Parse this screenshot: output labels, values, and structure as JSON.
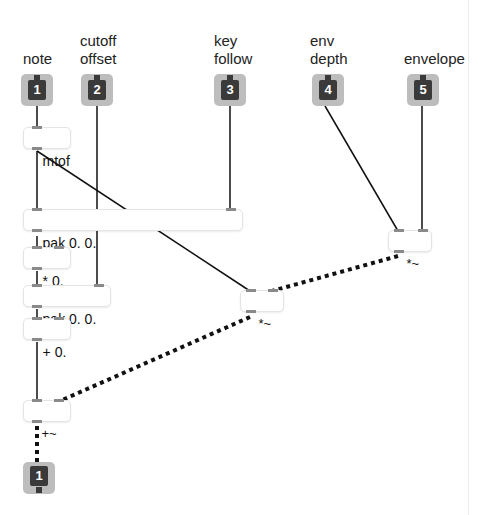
{
  "patch": {
    "inlets": [
      {
        "number": "1",
        "label": "note"
      },
      {
        "number": "2",
        "label": "cutoff\noffset"
      },
      {
        "number": "3",
        "label": "key\nfollow"
      },
      {
        "number": "4",
        "label": "env\ndepth"
      },
      {
        "number": "5",
        "label": "envelope"
      }
    ],
    "objects": {
      "mtof": "mtof",
      "pak_top": "pak 0. 0.",
      "mul": "* 0.",
      "pak_bottom": "pak 0. 0.",
      "add": "+ 0.",
      "sig_mul_right": "*~",
      "sig_mul_mid": "*~",
      "sig_add": "+~"
    },
    "outlets": [
      {
        "number": "1"
      }
    ]
  },
  "colors": {
    "inlet_bg": "#bdbdbd",
    "inlet_core": "#3a3a3a",
    "patchcord": "#111111",
    "signal_cord": "#111111"
  }
}
